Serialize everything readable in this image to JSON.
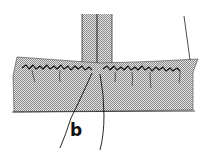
{
  "figure": {
    "type": "sewing-illustration",
    "labels": [
      {
        "id": "b",
        "text": "b"
      }
    ],
    "colors": {
      "ink": "#1a1a1a",
      "fabric_fill": "#bdbdbd",
      "background": "#ffffff"
    }
  }
}
